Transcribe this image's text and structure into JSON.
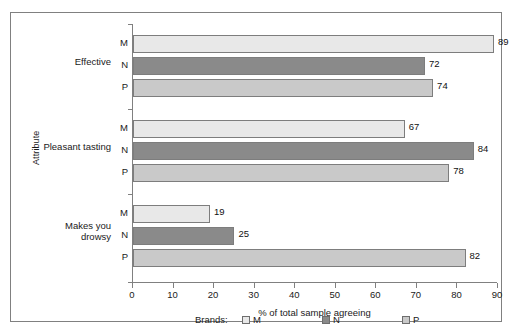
{
  "chart_data": {
    "type": "bar",
    "orientation": "horizontal",
    "title": "",
    "xlabel": "% of total sample agreeing",
    "ylabel": "Attribute",
    "xlim": [
      0,
      90
    ],
    "xticks": [
      0,
      10,
      20,
      30,
      40,
      50,
      60,
      70,
      80,
      90
    ],
    "grid": false,
    "legend_position": "bottom",
    "legend_title": "Brands:",
    "categories": [
      "Effective",
      "Pleasant tasting",
      "Makes you\ndrowsy"
    ],
    "series": [
      {
        "name": "M",
        "values": [
          89,
          67,
          19
        ],
        "color": "#e8e8e8"
      },
      {
        "name": "N",
        "values": [
          72,
          84,
          25
        ],
        "color": "#8a8a8a"
      },
      {
        "name": "P",
        "values": [
          74,
          78,
          82
        ],
        "color": "#c9c9c9"
      }
    ],
    "groups": [
      {
        "name": "Effective",
        "bars": [
          {
            "series": "M",
            "value": 89,
            "label": "89",
            "color": "#e8e8e8"
          },
          {
            "series": "N",
            "value": 72,
            "label": "72",
            "color": "#8a8a8a"
          },
          {
            "series": "P",
            "value": 74,
            "label": "74",
            "color": "#c9c9c9"
          }
        ]
      },
      {
        "name": "Pleasant tasting",
        "bars": [
          {
            "series": "M",
            "value": 67,
            "label": "67",
            "color": "#e8e8e8"
          },
          {
            "series": "N",
            "value": 84,
            "label": "84",
            "color": "#8a8a8a"
          },
          {
            "series": "P",
            "value": 78,
            "label": "78",
            "color": "#c9c9c9"
          }
        ]
      },
      {
        "name": "Makes you\ndrowsy",
        "bars": [
          {
            "series": "M",
            "value": 19,
            "label": "19",
            "color": "#e8e8e8"
          },
          {
            "series": "N",
            "value": 25,
            "label": "25",
            "color": "#8a8a8a"
          },
          {
            "series": "P",
            "value": 82,
            "label": "82",
            "color": "#c9c9c9"
          }
        ]
      }
    ]
  },
  "axes": {
    "x_title": "% of total sample agreeing",
    "y_title": "Attribute",
    "x_tick_labels": [
      "0",
      "10",
      "20",
      "30",
      "40",
      "50",
      "60",
      "70",
      "80",
      "90"
    ]
  },
  "legend": {
    "title": "Brands:",
    "items": [
      {
        "label": "M",
        "color": "#e8e8e8"
      },
      {
        "label": "N",
        "color": "#8a8a8a"
      },
      {
        "label": "P",
        "color": "#c9c9c9"
      }
    ]
  },
  "colors": {
    "axis": "#808080",
    "border": "#808080",
    "text": "#1a1a1a",
    "bar_outline": "#7d7d7d",
    "background": "#ffffff"
  }
}
